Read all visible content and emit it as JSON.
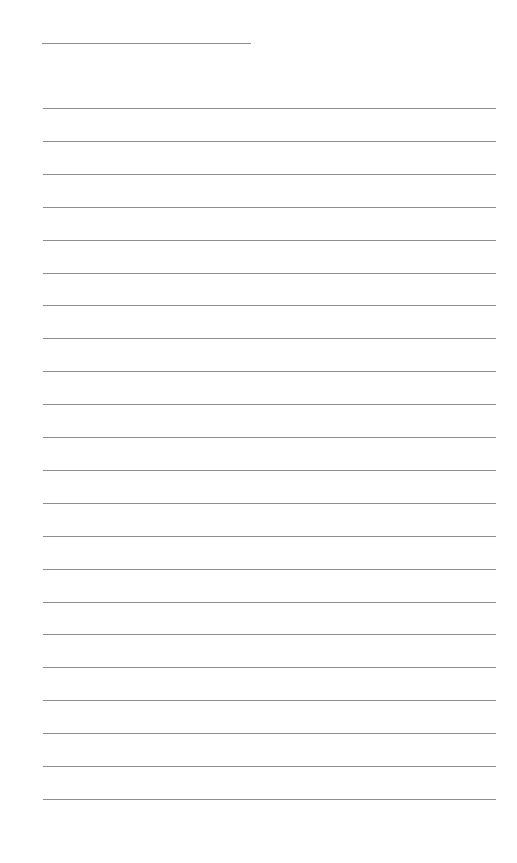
{
  "page": {
    "type": "lined-paper",
    "background": "#ffffff",
    "line_color": "#8e8e8e",
    "header_line": {
      "left": 42,
      "top": 43,
      "width": 209
    },
    "lines": {
      "count": 22,
      "first_top": 108,
      "spacing": 32.9,
      "left": 43,
      "right_end": 496
    }
  }
}
